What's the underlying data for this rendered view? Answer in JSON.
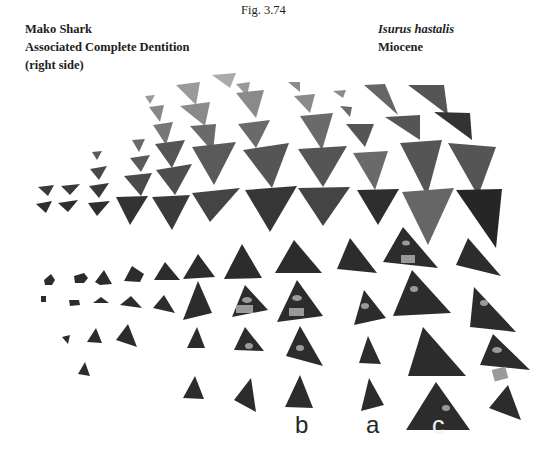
{
  "figure": {
    "number": "Fig. 3.74",
    "left_caption": [
      "Mako Shark",
      "Associated Complete Dentition",
      "(right side)"
    ],
    "right_caption": {
      "species": "Isurus hastalis",
      "epoch": "Miocene"
    }
  },
  "plate": {
    "description": "Photograph of associated shark teeth arranged in rows",
    "colors": {
      "upper_teeth": "#7a7a7a",
      "lower_teeth": "#2e2e2e",
      "dark_tooth": "#262626",
      "label_patch": "#9a9a9a"
    },
    "labels": [
      {
        "id": "b",
        "text": "b"
      },
      {
        "id": "a",
        "text": "a"
      },
      {
        "id": "c",
        "text": "c"
      }
    ]
  }
}
